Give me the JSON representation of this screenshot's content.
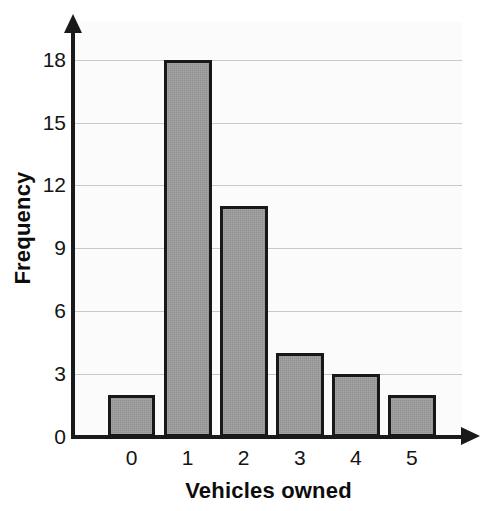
{
  "chart_data": {
    "type": "bar",
    "title": "",
    "xlabel": "Vehicles owned",
    "ylabel": "Frequency",
    "categories": [
      "0",
      "1",
      "2",
      "3",
      "4",
      "5"
    ],
    "values": [
      2,
      18,
      11,
      4,
      3,
      2
    ],
    "series": [
      {
        "name": "Frequency",
        "values": [
          2,
          18,
          11,
          4,
          3,
          2
        ]
      }
    ],
    "yticks": [
      0,
      3,
      6,
      9,
      12,
      15,
      18
    ],
    "ytick_labels": [
      "0",
      "3",
      "6",
      "9",
      "12",
      "15",
      "18"
    ],
    "xtick_labels": [
      "0",
      "1",
      "2",
      "3",
      "4",
      "5"
    ],
    "ylim": [
      0,
      19.8
    ],
    "xlim": [
      -0.6,
      5.9
    ],
    "grid": true,
    "grid_axis": "y",
    "legend": false,
    "legend_position": "none",
    "bar_fill_color": "#9b9b9b",
    "bar_edge_color": "#181818",
    "gridline_color": "#c8c8c8",
    "axis_color": "#1a1a1a",
    "plot_background": "#fbfbfb",
    "page_background": "#ffffff",
    "axis_arrows": true
  }
}
